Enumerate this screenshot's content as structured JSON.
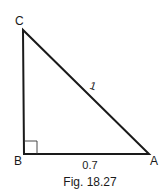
{
  "figure": {
    "caption": "Fig. 18.27",
    "shape": "right-triangle",
    "right_angle_at": "B",
    "vertices": {
      "A": {
        "label": "A"
      },
      "B": {
        "label": "B"
      },
      "C": {
        "label": "C"
      }
    },
    "sides": {
      "hypotenuse_CA": {
        "label": "1"
      },
      "base_BA": {
        "label": "0.7"
      },
      "leg_BC": {
        "label": ""
      }
    },
    "colors": {
      "stroke": "#1a1a1a",
      "background": "#ffffff"
    }
  }
}
